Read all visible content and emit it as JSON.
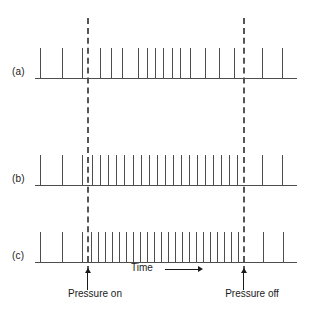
{
  "figure": {
    "type": "spike-raster",
    "background": "#ffffff",
    "ink_color": "#4d4d4d",
    "text_color": "#1a1a1a",
    "width": 313,
    "height": 314
  },
  "axis": {
    "time_label": "Time",
    "time_arrow": "right-arrow"
  },
  "events": [
    {
      "id": "pressure-on",
      "label": "Pressure on",
      "x": 87,
      "label_x": 95,
      "label_y": 288
    },
    {
      "id": "pressure-off",
      "label": "Pressure off",
      "x": 243,
      "label_x": 252,
      "label_y": 288
    }
  ],
  "traces": [
    {
      "id": "a",
      "label": "(a)",
      "label_x": 12,
      "label_y": 66,
      "baseline_y": 78,
      "baseline_x": 35,
      "baseline_width": 262,
      "spike_height": 30,
      "spikes": [
        40,
        62,
        82,
        100,
        111,
        122,
        138,
        147,
        155,
        163,
        172,
        180,
        190,
        205,
        219,
        234,
        262,
        282
      ]
    },
    {
      "id": "b",
      "label": "(b)",
      "label_x": 12,
      "label_y": 173,
      "baseline_y": 185,
      "baseline_x": 35,
      "baseline_width": 262,
      "spike_height": 30,
      "spikes": [
        40,
        62,
        82,
        92,
        100,
        108,
        116,
        124,
        133,
        141,
        149,
        157,
        165,
        173,
        181,
        189,
        197,
        205,
        213,
        221,
        229,
        237,
        262,
        282
      ]
    },
    {
      "id": "c",
      "label": "(c)",
      "label_x": 12,
      "label_y": 250,
      "baseline_y": 262,
      "baseline_x": 35,
      "baseline_width": 262,
      "spike_height": 30,
      "spikes": [
        40,
        62,
        82,
        91,
        98,
        105,
        112,
        119,
        126,
        133,
        140,
        147,
        154,
        161,
        168,
        175,
        182,
        189,
        196,
        203,
        210,
        217,
        224,
        231,
        238,
        263,
        283
      ]
    }
  ],
  "chart_data": {
    "type": "raster",
    "title": "",
    "xlabel": "Time",
    "ylabel": "",
    "grid": false,
    "legend": "none",
    "annotations": [
      "Pressure on",
      "Pressure off",
      "Time"
    ],
    "series": [
      {
        "name": "(a)",
        "description": "low firing rate response",
        "spike_times": [
          40,
          62,
          82,
          100,
          111,
          122,
          138,
          147,
          155,
          163,
          172,
          180,
          190,
          205,
          219,
          234,
          262,
          282
        ],
        "spike_count": 18
      },
      {
        "name": "(b)",
        "description": "moderate firing rate response",
        "spike_times": [
          40,
          62,
          82,
          92,
          100,
          108,
          116,
          124,
          133,
          141,
          149,
          157,
          165,
          173,
          181,
          189,
          197,
          205,
          213,
          221,
          229,
          237,
          262,
          282
        ],
        "spike_count": 24
      },
      {
        "name": "(c)",
        "description": "high firing rate response",
        "spike_times": [
          40,
          62,
          82,
          91,
          98,
          105,
          112,
          119,
          126,
          133,
          140,
          147,
          154,
          161,
          168,
          175,
          182,
          189,
          196,
          203,
          210,
          217,
          224,
          231,
          238,
          263,
          283
        ],
        "spike_count": 27
      }
    ],
    "stimulus_window": {
      "start": 87,
      "end": 243,
      "on_label": "Pressure on",
      "off_label": "Pressure off"
    }
  }
}
